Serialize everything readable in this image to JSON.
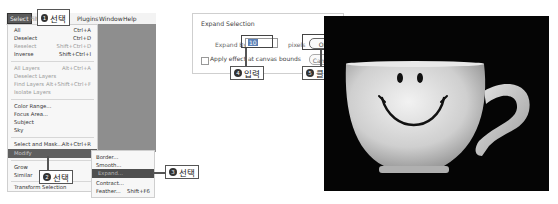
{
  "menubar": {
    "items": [
      {
        "label": "Select",
        "active": true
      },
      {
        "label": "Filter"
      },
      {
        "label": "Plugins"
      },
      {
        "label": "Window"
      },
      {
        "label": "Help"
      }
    ]
  },
  "select_menu": {
    "items": [
      {
        "label": "All",
        "shortcut": "Ctrl+A",
        "disabled": false
      },
      {
        "label": "Deselect",
        "shortcut": "Ctrl+D",
        "disabled": false
      },
      {
        "label": "Reselect",
        "shortcut": "Shift+Ctrl+D",
        "disabled": true
      },
      {
        "label": "Inverse",
        "shortcut": "Shift+Ctrl+I",
        "disabled": false
      },
      {
        "label": "All Layers",
        "shortcut": "Alt+Ctrl+A",
        "disabled": true
      },
      {
        "label": "Deselect Layers",
        "shortcut": "",
        "disabled": true
      },
      {
        "label": "Find Layers",
        "shortcut": "Alt+Shift+Ctrl+F",
        "disabled": true
      },
      {
        "label": "Isolate Layers",
        "shortcut": "",
        "disabled": true
      },
      {
        "label": "Color Range...",
        "shortcut": "",
        "disabled": false
      },
      {
        "label": "Focus Area...",
        "shortcut": "",
        "disabled": false
      },
      {
        "label": "Subject",
        "shortcut": "",
        "disabled": false
      },
      {
        "label": "Sky",
        "shortcut": "",
        "disabled": false
      },
      {
        "label": "Select and Mask...",
        "shortcut": "Alt+Ctrl+R",
        "disabled": false
      },
      {
        "label": "Modify",
        "shortcut": "▸",
        "highlighted": true
      },
      {
        "label": "Grow",
        "shortcut": "",
        "disabled": false
      },
      {
        "label": "Similar",
        "shortcut": "",
        "disabled": false
      },
      {
        "label": "Transform Selection",
        "shortcut": "",
        "disabled": false
      }
    ]
  },
  "modify_submenu": {
    "items": [
      {
        "label": "Border...",
        "shortcut": ""
      },
      {
        "label": "Smooth...",
        "shortcut": ""
      },
      {
        "label": "Expand...",
        "shortcut": "",
        "highlighted": true
      },
      {
        "label": "Contract...",
        "shortcut": ""
      },
      {
        "label": "Feather...",
        "shortcut": "Shift+F6"
      }
    ]
  },
  "callouts": [
    {
      "num": "1",
      "text": "선택"
    },
    {
      "num": "2",
      "text": "선택"
    },
    {
      "num": "3",
      "text": "선택"
    },
    {
      "num": "4",
      "text": "입력"
    },
    {
      "num": "5",
      "text": "클릭"
    }
  ],
  "dialog": {
    "title": "Expand Selection",
    "close": "×",
    "expand_label": "Expand By:",
    "expand_value": "10",
    "unit": "pixels",
    "checkbox_label": "Apply effect at canvas bounds",
    "ok": "OK",
    "cancel": "Cancel"
  },
  "photo": {
    "description": "White cup with smiley face on black background"
  }
}
